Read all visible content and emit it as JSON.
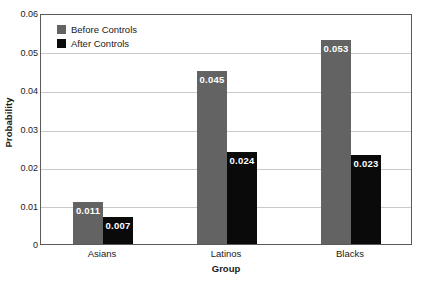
{
  "chart_data": {
    "type": "bar",
    "title": "",
    "xlabel": "Group",
    "ylabel": "Probability",
    "categories": [
      "Asians",
      "Latinos",
      "Blacks"
    ],
    "series": [
      {
        "name": "Before Controls",
        "color": "#636363",
        "values": [
          0.011,
          0.045,
          0.053
        ],
        "labels": [
          "0.011",
          "0.045",
          "0.053"
        ]
      },
      {
        "name": "After Controls",
        "color": "#0a0a0a",
        "values": [
          0.007,
          0.024,
          0.023
        ],
        "labels": [
          "0.007",
          "0.024",
          "0.023"
        ]
      }
    ],
    "ylim": [
      0,
      0.06
    ],
    "yticks": [
      0,
      0.01,
      0.02,
      0.03,
      0.04,
      0.05,
      0.06
    ],
    "ytick_labels": [
      "0",
      "0.01",
      "0.02",
      "0.03",
      "0.04",
      "0.05",
      "0.06"
    ],
    "grid": "horizontal",
    "legend_position": "top-left",
    "data_labels": "inside-top-white-bold"
  },
  "axes": {
    "y_title": "Probability",
    "x_title": "Group"
  },
  "legend": {
    "items": [
      {
        "label": "Before Controls",
        "color": "#636363"
      },
      {
        "label": "After Controls",
        "color": "#0a0a0a"
      }
    ]
  },
  "colors": {
    "before_controls": "#636363",
    "after_controls": "#0a0a0a",
    "gridline": "#c9c9c9",
    "axis_border": "#5a5a5a",
    "background": "#ffffff",
    "text": "#1a1a1a",
    "value_label": "#ffffff"
  }
}
